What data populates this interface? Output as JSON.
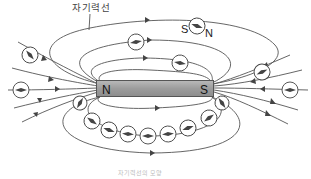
{
  "diagram": {
    "title_label": "자기력선",
    "magnet": {
      "north_label": "N",
      "south_label": "S",
      "color": "#9c9c9c"
    },
    "compass_labels": {
      "south": "S",
      "north": "N"
    },
    "caption": "자기력선의 모양",
    "compasses": [
      {
        "x": 197,
        "y": 26,
        "angle": 20
      },
      {
        "x": 136,
        "y": 42,
        "angle": -10
      },
      {
        "x": 180,
        "y": 63,
        "angle": 10
      },
      {
        "x": 30,
        "y": 55,
        "angle": 50
      },
      {
        "x": 21,
        "y": 90,
        "angle": 0
      },
      {
        "x": 80,
        "y": 103,
        "angle": -60
      },
      {
        "x": 92,
        "y": 121,
        "angle": 35
      },
      {
        "x": 109,
        "y": 130,
        "angle": 20
      },
      {
        "x": 128,
        "y": 134,
        "angle": 5
      },
      {
        "x": 148,
        "y": 136,
        "angle": 0
      },
      {
        "x": 168,
        "y": 134,
        "angle": -5
      },
      {
        "x": 188,
        "y": 128,
        "angle": -20
      },
      {
        "x": 209,
        "y": 118,
        "angle": -35
      },
      {
        "x": 222,
        "y": 103,
        "angle": 55
      },
      {
        "x": 262,
        "y": 72,
        "angle": -25
      },
      {
        "x": 290,
        "y": 90,
        "angle": 180
      }
    ],
    "line_color": "#555555"
  }
}
